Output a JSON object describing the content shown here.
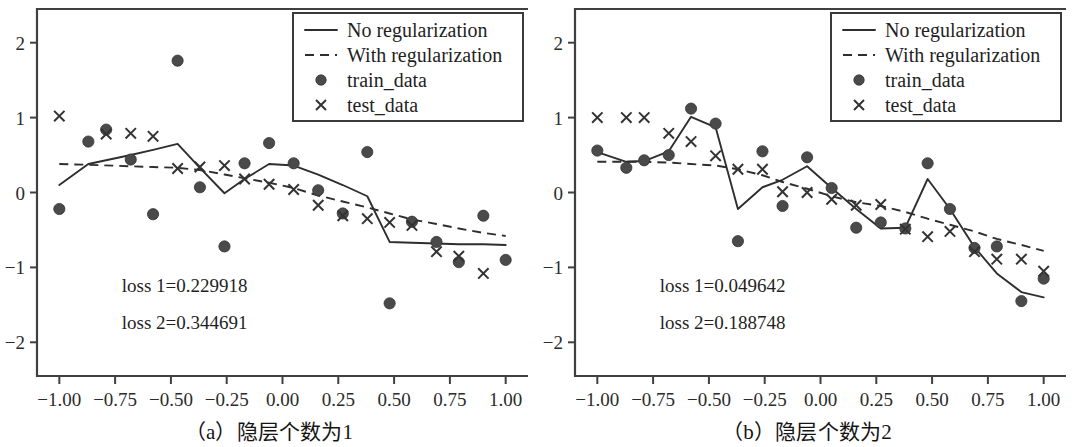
{
  "figure": {
    "background": "#ffffff",
    "ink": "#2e2e2e",
    "panel_count": 2
  },
  "chart_data": [
    {
      "type": "scatter",
      "panel_id": "a",
      "caption": "（a）隐层个数为1",
      "title": "",
      "xlabel": "",
      "ylabel": "",
      "xlim": [
        -1.1,
        1.1
      ],
      "ylim": [
        -2.45,
        2.45
      ],
      "grid": false,
      "xticks": [
        -1.0,
        -0.75,
        -0.5,
        -0.25,
        0.0,
        0.25,
        0.5,
        0.75,
        1.0
      ],
      "xtick_labels": [
        "-1.00",
        "-0.75",
        "-0.50",
        "-0.25",
        "0.00",
        "0.25",
        "0.50",
        "0.75",
        "1.00"
      ],
      "yticks": [
        2,
        1,
        0,
        -1,
        -2
      ],
      "ytick_labels": [
        "2",
        "1",
        "0",
        "-1",
        "-2"
      ],
      "legend_position": "top-right",
      "annotations": [
        {
          "name": "loss1",
          "text": "loss 1=0.229918",
          "x": -0.72,
          "y": -1.33
        },
        {
          "name": "loss2",
          "text": "loss 2=0.344691",
          "x": -0.72,
          "y": -1.82
        }
      ],
      "series": [
        {
          "name": "No regularization",
          "style": "solid",
          "x": [
            -1.0,
            -0.87,
            -0.68,
            -0.58,
            -0.47,
            -0.37,
            -0.26,
            -0.17,
            -0.06,
            0.05,
            0.16,
            0.27,
            0.38,
            0.48,
            0.58,
            0.69,
            0.79,
            0.9,
            1.0
          ],
          "y": [
            0.1,
            0.38,
            0.5,
            0.57,
            0.65,
            0.33,
            -0.01,
            0.18,
            0.38,
            0.36,
            0.24,
            0.1,
            -0.05,
            -0.66,
            -0.67,
            -0.68,
            -0.69,
            -0.69,
            -0.7
          ]
        },
        {
          "name": "With regularization",
          "style": "dashed",
          "x": [
            -1.0,
            -0.87,
            -0.68,
            -0.58,
            -0.47,
            -0.37,
            -0.26,
            -0.17,
            -0.06,
            0.05,
            0.16,
            0.27,
            0.38,
            0.48,
            0.58,
            0.69,
            0.79,
            0.9,
            1.0
          ],
          "y": [
            0.38,
            0.37,
            0.35,
            0.34,
            0.33,
            0.3,
            0.24,
            0.19,
            0.13,
            0.06,
            -0.04,
            -0.12,
            -0.2,
            -0.28,
            -0.36,
            -0.42,
            -0.48,
            -0.54,
            -0.58
          ]
        }
      ],
      "points": [
        {
          "name": "train_data",
          "marker": "dot",
          "x": [
            -1.0,
            -0.87,
            -0.79,
            -0.68,
            -0.58,
            -0.47,
            -0.37,
            -0.26,
            -0.17,
            -0.06,
            0.05,
            0.16,
            0.27,
            0.38,
            0.48,
            0.58,
            0.69,
            0.79,
            0.9,
            1.0
          ],
          "y": [
            -0.22,
            0.68,
            0.84,
            0.44,
            -0.29,
            1.76,
            0.07,
            -0.72,
            0.39,
            0.66,
            0.39,
            0.03,
            -0.28,
            0.54,
            -1.48,
            -0.39,
            -0.66,
            -0.93,
            -0.31,
            -0.9
          ]
        },
        {
          "name": "test_data",
          "marker": "cross",
          "x": [
            -1.0,
            -0.79,
            -0.68,
            -0.58,
            -0.47,
            -0.37,
            -0.26,
            -0.17,
            -0.06,
            0.05,
            0.16,
            0.27,
            0.38,
            0.48,
            0.58,
            0.69,
            0.79,
            0.9
          ],
          "y": [
            1.02,
            0.78,
            0.79,
            0.75,
            0.32,
            0.34,
            0.36,
            0.18,
            0.11,
            0.04,
            -0.17,
            -0.31,
            -0.35,
            -0.4,
            -0.44,
            -0.79,
            -0.85,
            -1.08
          ]
        }
      ],
      "legend": [
        {
          "label": "No regularization",
          "marker": "solid-line"
        },
        {
          "label": "With regularization",
          "marker": "dashed-line"
        },
        {
          "label": "train_data",
          "marker": "dot"
        },
        {
          "label": "test_data",
          "marker": "cross"
        }
      ]
    },
    {
      "type": "scatter",
      "panel_id": "b",
      "caption": "（b）隐层个数为2",
      "title": "",
      "xlabel": "",
      "ylabel": "",
      "xlim": [
        -1.1,
        1.1
      ],
      "ylim": [
        -2.45,
        2.45
      ],
      "grid": false,
      "xticks": [
        -1.0,
        -0.75,
        -0.5,
        -0.25,
        0.0,
        0.25,
        0.5,
        0.75,
        1.0
      ],
      "xtick_labels": [
        "-1.00",
        "-0.75",
        "-0.50",
        "-0.25",
        "0.00",
        "0.25",
        "0.50",
        "0.75",
        "1.00"
      ],
      "yticks": [
        2,
        1,
        0,
        -1,
        -2
      ],
      "ytick_labels": [
        "2",
        "1",
        "0",
        "-1",
        "-2"
      ],
      "legend_position": "top-right",
      "annotations": [
        {
          "name": "loss1",
          "text": "loss 1=0.049642",
          "x": -0.72,
          "y": -1.33
        },
        {
          "name": "loss2",
          "text": "loss 2=0.188748",
          "x": -0.72,
          "y": -1.82
        }
      ],
      "series": [
        {
          "name": "No regularization",
          "style": "solid",
          "x": [
            -1.0,
            -0.87,
            -0.79,
            -0.68,
            -0.58,
            -0.47,
            -0.37,
            -0.26,
            -0.17,
            -0.06,
            0.05,
            0.16,
            0.27,
            0.38,
            0.48,
            0.58,
            0.69,
            0.79,
            0.9,
            1.0
          ],
          "y": [
            0.54,
            0.41,
            0.42,
            0.55,
            1.01,
            0.87,
            -0.22,
            0.07,
            0.17,
            0.35,
            0.06,
            -0.22,
            -0.48,
            -0.47,
            0.18,
            -0.22,
            -0.73,
            -1.08,
            -1.33,
            -1.4
          ]
        },
        {
          "name": "With regularization",
          "style": "dashed",
          "x": [
            -1.0,
            -0.87,
            -0.79,
            -0.68,
            -0.58,
            -0.47,
            -0.37,
            -0.26,
            -0.17,
            -0.06,
            0.05,
            0.16,
            0.27,
            0.38,
            0.48,
            0.58,
            0.69,
            0.79,
            0.9,
            1.0
          ],
          "y": [
            0.41,
            0.41,
            0.41,
            0.4,
            0.38,
            0.36,
            0.31,
            0.23,
            0.14,
            0.05,
            -0.05,
            -0.13,
            -0.18,
            -0.26,
            -0.35,
            -0.43,
            -0.52,
            -0.62,
            -0.7,
            -0.78
          ]
        }
      ],
      "points": [
        {
          "name": "train_data",
          "marker": "dot",
          "x": [
            -1.0,
            -0.87,
            -0.79,
            -0.68,
            -0.58,
            -0.47,
            -0.37,
            -0.26,
            -0.17,
            -0.06,
            0.05,
            0.16,
            0.27,
            0.38,
            0.48,
            0.58,
            0.69,
            0.79,
            0.9,
            1.0
          ],
          "y": [
            0.56,
            0.33,
            0.43,
            0.5,
            1.12,
            0.92,
            -0.65,
            0.55,
            -0.18,
            0.47,
            0.06,
            -0.47,
            -0.4,
            -0.48,
            0.39,
            -0.22,
            -0.74,
            -0.72,
            -1.45,
            -1.15
          ]
        },
        {
          "name": "test_data",
          "marker": "cross",
          "x": [
            -1.0,
            -0.87,
            -0.79,
            -0.68,
            -0.58,
            -0.47,
            -0.37,
            -0.26,
            -0.17,
            -0.06,
            0.05,
            0.16,
            0.27,
            0.38,
            0.48,
            0.58,
            0.69,
            0.79,
            0.9,
            1.0
          ],
          "y": [
            1.0,
            1.0,
            1.0,
            0.79,
            0.68,
            0.49,
            0.31,
            0.31,
            0.01,
            0.0,
            -0.09,
            -0.17,
            -0.16,
            -0.49,
            -0.59,
            -0.52,
            -0.79,
            -0.89,
            -0.89,
            -1.05
          ]
        }
      ],
      "legend": [
        {
          "label": "No regularization",
          "marker": "solid-line"
        },
        {
          "label": "With regularization",
          "marker": "dashed-line"
        },
        {
          "label": "train_data",
          "marker": "dot"
        },
        {
          "label": "test_data",
          "marker": "cross"
        }
      ]
    }
  ]
}
